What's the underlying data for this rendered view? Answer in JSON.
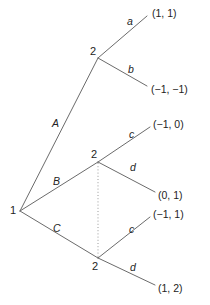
{
  "figure": {
    "type": "extensive-form-game-tree",
    "stroke_color": "#6b6b6b",
    "text_color": "#232323",
    "background_color": "#ffffff",
    "info_set_style": "dotted"
  },
  "nodes": {
    "root": {
      "player": "1",
      "x": 20,
      "y": 211
    },
    "top": {
      "player": "2",
      "x": 98,
      "y": 58
    },
    "middle": {
      "player": "2",
      "x": 98,
      "y": 162
    },
    "bottom": {
      "player": "2",
      "x": 98,
      "y": 258
    }
  },
  "edges": {
    "root_to_top": "A",
    "root_to_middle": "B",
    "root_to_bottom": "C",
    "top_upper": "a",
    "top_lower": "b",
    "middle_upper": "c",
    "middle_lower": "d",
    "bottom_upper": "c",
    "bottom_lower": "d"
  },
  "payoffs": {
    "top_a": "(1, 1)",
    "top_b": "(−1, −1)",
    "middle_c": "(−1, 0)",
    "middle_d": "(0, 1)",
    "bottom_c": "(−1, 1)",
    "bottom_d": "(1, 2)"
  }
}
